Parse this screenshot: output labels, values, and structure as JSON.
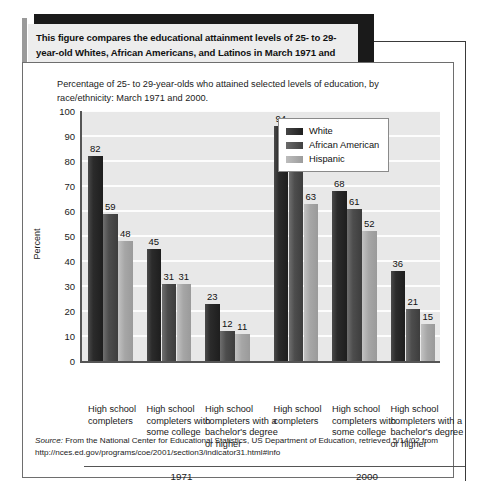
{
  "callout": {
    "text": "This figure compares the educational attainment levels of 25- to 29- year-old Whites, African Americans, and Latinos in March 1971 and March 2000."
  },
  "figure": {
    "subtitle": "Percentage of 25- to 29-year-olds who attained selected levels of education, by race/ethnicity: March 1971 and 2000.",
    "source_prefix": "Source:",
    "source_text": " From the National Center for Educational Statistics, US Department of Education, retrieved 5/14/02 from http://nces.ed.gov/programs/coe/2001/section3/indicator31.html#info"
  },
  "chart_data": {
    "type": "bar",
    "title": "Percentage of 25- to 29-year-olds who attained selected levels of education, by race/ethnicity: March 1971 and 2000.",
    "xlabel": "",
    "ylabel": "Percent",
    "ylim": [
      0,
      100
    ],
    "yticks": [
      100,
      90,
      80,
      70,
      60,
      50,
      40,
      30,
      20,
      10,
      0
    ],
    "grid": true,
    "legend_position": "top-right",
    "groups": [
      "1971",
      "2000"
    ],
    "categories": [
      "High school completers",
      "High school completers with some college",
      "High school completers with a bachelor's degree or higher",
      "High school completers",
      "High school completers with some college",
      "High school completers with a bachelor's degree or higher"
    ],
    "series": [
      {
        "name": "White",
        "color": "#2b2b2b",
        "values": [
          82,
          45,
          23,
          94,
          68,
          36
        ]
      },
      {
        "name": "African American",
        "color": "#4d4d4d",
        "values": [
          59,
          31,
          12,
          87,
          61,
          21
        ]
      },
      {
        "name": "Hispanic",
        "color": "#a6a6a6",
        "values": [
          48,
          31,
          11,
          63,
          52,
          15
        ]
      }
    ]
  }
}
